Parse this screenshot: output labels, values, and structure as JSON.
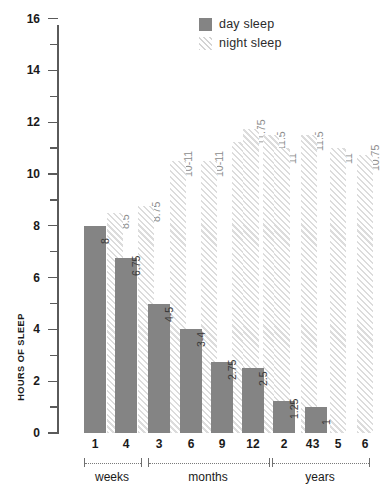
{
  "chart_data": {
    "type": "bar",
    "title": "",
    "subtitle": "",
    "xlabel": "",
    "ylabel": "HOURS OF SLEEP",
    "ylim": [
      0,
      17
    ],
    "ytick_step": 1,
    "ytick_labels": [
      "0",
      "2",
      "4",
      "6",
      "8",
      "10",
      "12",
      "14",
      "16"
    ],
    "ytick_values": [
      0,
      2,
      4,
      6,
      8,
      10,
      12,
      14,
      16
    ],
    "grid": false,
    "legend_position": "top-right",
    "legend": [
      {
        "key": "day",
        "label": "day sleep",
        "color": "#848484",
        "pattern": "solid"
      },
      {
        "key": "night",
        "label": "night sleep",
        "color": "#dcdcdc",
        "pattern": "diagonal-hatch"
      }
    ],
    "categories": [
      "1",
      "4",
      "3",
      "6",
      "9",
      "12",
      "2",
      "3",
      "4",
      "5",
      "6"
    ],
    "groups": [
      {
        "name": "weeks",
        "categories": [
          "1",
          "4"
        ]
      },
      {
        "name": "months",
        "categories": [
          "3",
          "6",
          "9",
          "12"
        ]
      },
      {
        "name": "years",
        "categories": [
          "2",
          "3",
          "4",
          "5",
          "6"
        ]
      }
    ],
    "series": [
      {
        "name": "day sleep",
        "values": [
          8,
          6.75,
          4.5,
          3.5,
          2.75,
          2.5,
          1.25,
          1,
          null,
          null,
          null
        ],
        "labels": [
          "8",
          "6.75",
          "4-5",
          "3-4",
          "2.75",
          "2.5",
          "1.25",
          "1",
          "",
          "",
          ""
        ]
      },
      {
        "name": "night sleep",
        "values": [
          8.5,
          8.75,
          10.5,
          10.5,
          11.25,
          11.5,
          11.75,
          11,
          11.5,
          11,
          10.75
        ],
        "labels": [
          "8.5",
          "8.75",
          "10-11",
          "10-11",
          "11.25",
          "11.5",
          "11.75",
          "11",
          "11.5",
          "11",
          "10.75"
        ]
      }
    ],
    "bars": [
      {
        "group": "weeks",
        "category": "1",
        "day_label": "8",
        "night_label": "8.5",
        "day_value": 8,
        "night_value": 8.5
      },
      {
        "group": "weeks",
        "category": "4",
        "day_label": "6.75",
        "night_label": "8.75",
        "day_value": 6.75,
        "night_value": 8.75
      },
      {
        "group": "months",
        "category": "3",
        "day_label": "4-5",
        "night_label": "10-11",
        "day_value": 5,
        "night_value": 10.5
      },
      {
        "group": "months",
        "category": "6",
        "day_label": "3-4",
        "night_label": "10-11",
        "day_value": 4,
        "night_value": 10.5
      },
      {
        "group": "months",
        "category": "9",
        "day_label": "2.75",
        "night_label": "11.25",
        "day_value": 2.75,
        "night_value": 11.25
      },
      {
        "group": "months",
        "category": "12",
        "day_label": "2.5",
        "night_label": "11.5",
        "day_value": 2.5,
        "night_value": 11.5
      },
      {
        "group": "years",
        "category": "2",
        "day_label": "1.25",
        "night_label": "11.75",
        "day_value": 1.25,
        "night_value": 11.75
      },
      {
        "group": "years",
        "category": "3",
        "day_label": "1",
        "night_label": "11",
        "day_value": 1,
        "night_value": 11
      },
      {
        "group": "years",
        "category": "4",
        "day_label": "",
        "night_label": "11.5",
        "day_value": null,
        "night_value": 11.5
      },
      {
        "group": "years",
        "category": "5",
        "day_label": "",
        "night_label": "11",
        "day_value": null,
        "night_value": 11
      },
      {
        "group": "years",
        "category": "6",
        "day_label": "",
        "night_label": "10.75",
        "day_value": null,
        "night_value": 10.75
      }
    ]
  },
  "axis": {
    "y_title": "HOURS OF SLEEP",
    "ticks": [
      "16",
      "14",
      "12",
      "10",
      "8",
      "6",
      "4",
      "2",
      "0"
    ]
  },
  "legend": {
    "day": "day sleep",
    "night": "night sleep"
  },
  "x_axis": {
    "labels": [
      "1",
      "4",
      "3",
      "6",
      "9",
      "12",
      "2",
      "3",
      "4",
      "5",
      "6"
    ],
    "group_names": [
      "weeks",
      "months",
      "years"
    ]
  },
  "colors": {
    "day_bar": "#848484",
    "night_hatch": "#dcdcdc",
    "axis": "#5a5a5a",
    "text": "#1a1a1a",
    "night_label_text": "#8d8d8d"
  }
}
